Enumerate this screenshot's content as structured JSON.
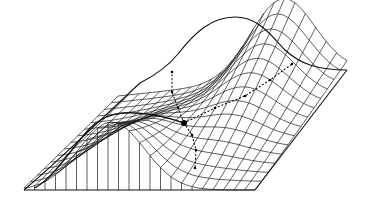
{
  "figure": {
    "type": "3d-wireframe-surface",
    "colors": {
      "stroke": "#111111",
      "background": "#ffffff"
    },
    "landmarks": {
      "saddle_point": [
        184,
        123
      ],
      "back_peak_top": [
        235,
        17
      ],
      "front_ridge_top": [
        130,
        116
      ],
      "base_left": [
        24,
        190
      ],
      "base_right": [
        255,
        190
      ],
      "back_right_corner": [
        347,
        70
      ],
      "back_left_corner": [
        140,
        83
      ]
    },
    "paths": [
      {
        "name": "path-to-upper-right",
        "points": [
          [
            184,
            123
          ],
          [
            215,
            108
          ],
          [
            245,
            96
          ],
          [
            270,
            80
          ],
          [
            292,
            64
          ]
        ]
      },
      {
        "name": "path-to-upper-left",
        "points": [
          [
            184,
            123
          ],
          [
            178,
            108
          ],
          [
            172,
            92
          ],
          [
            172,
            72
          ]
        ]
      },
      {
        "name": "path-down-front",
        "points": [
          [
            184,
            123
          ],
          [
            192,
            135
          ],
          [
            196,
            150
          ],
          [
            195,
            168
          ]
        ]
      }
    ]
  }
}
